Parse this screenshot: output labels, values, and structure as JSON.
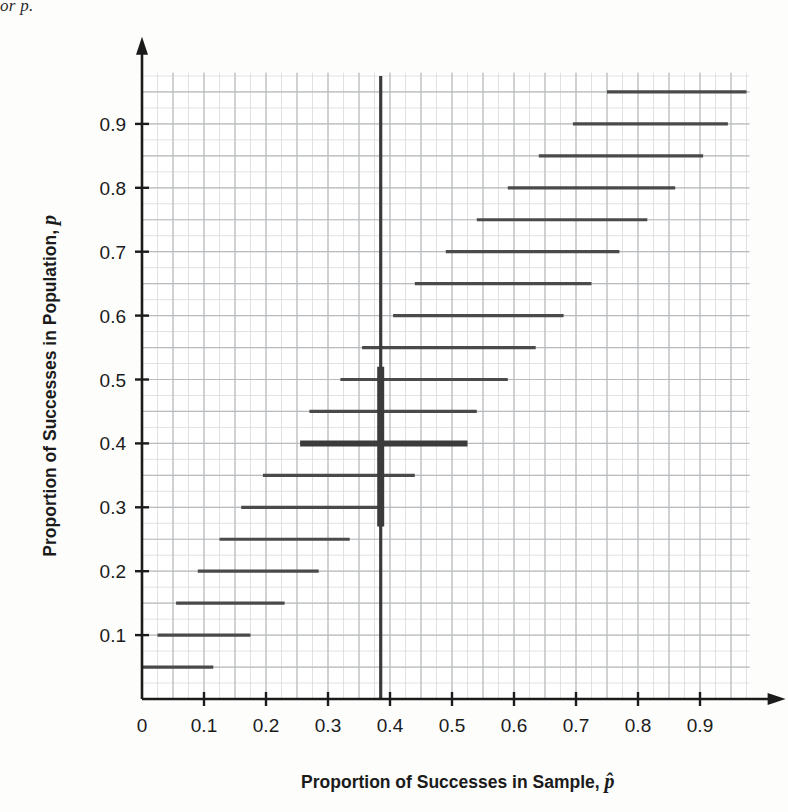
{
  "caption_fragment": "or p.",
  "axes": {
    "x_title_main": "Proportion of Successes in Sample, ",
    "x_title_symbol": "p̂",
    "y_title_main": "Proportion of Successes in Population, ",
    "y_title_symbol": "p",
    "x_ticks": [
      "0",
      "0.1",
      "0.2",
      "0.3",
      "0.4",
      "0.5",
      "0.6",
      "0.7",
      "0.8",
      "0.9"
    ],
    "y_ticks": [
      "0.1",
      "0.2",
      "0.3",
      "0.4",
      "0.5",
      "0.6",
      "0.7",
      "0.8",
      "0.9"
    ]
  },
  "colors": {
    "ink": "#1b1b1b",
    "grid_major": "#b9bcbe",
    "grid_minor": "#d8dadb",
    "segment": "#4a4a4a",
    "highlight": "#3b3b3b",
    "background": "#fdfdfb"
  },
  "chart_data": {
    "type": "line",
    "title": "",
    "xlabel": "Proportion of Successes in Sample, p-hat",
    "ylabel": "Proportion of Successes in Population, p",
    "xlim": [
      0,
      0.98
    ],
    "ylim": [
      0,
      0.98
    ],
    "grid": true,
    "grid_minor_step": 0.025,
    "grid_major_step": 0.05,
    "legend": "none",
    "reference_line": {
      "orientation": "vertical",
      "x": 0.385,
      "y_from": 0.0,
      "y_to": 0.975,
      "emphasis_y_from": 0.27,
      "emphasis_y_to": 0.52
    },
    "highlighted_interval": {
      "p": 0.4,
      "x_low": 0.255,
      "x_high": 0.525
    },
    "intervals": [
      {
        "p": 0.05,
        "x_low": 0.0,
        "x_high": 0.115
      },
      {
        "p": 0.1,
        "x_low": 0.025,
        "x_high": 0.175
      },
      {
        "p": 0.15,
        "x_low": 0.055,
        "x_high": 0.23
      },
      {
        "p": 0.2,
        "x_low": 0.09,
        "x_high": 0.285
      },
      {
        "p": 0.25,
        "x_low": 0.125,
        "x_high": 0.335
      },
      {
        "p": 0.3,
        "x_low": 0.16,
        "x_high": 0.39
      },
      {
        "p": 0.35,
        "x_low": 0.195,
        "x_high": 0.44
      },
      {
        "p": 0.4,
        "x_low": 0.255,
        "x_high": 0.525
      },
      {
        "p": 0.45,
        "x_low": 0.27,
        "x_high": 0.54
      },
      {
        "p": 0.5,
        "x_low": 0.32,
        "x_high": 0.59
      },
      {
        "p": 0.55,
        "x_low": 0.355,
        "x_high": 0.635
      },
      {
        "p": 0.6,
        "x_low": 0.405,
        "x_high": 0.68
      },
      {
        "p": 0.65,
        "x_low": 0.44,
        "x_high": 0.725
      },
      {
        "p": 0.7,
        "x_low": 0.49,
        "x_high": 0.77
      },
      {
        "p": 0.75,
        "x_low": 0.54,
        "x_high": 0.815
      },
      {
        "p": 0.8,
        "x_low": 0.59,
        "x_high": 0.86
      },
      {
        "p": 0.85,
        "x_low": 0.64,
        "x_high": 0.905
      },
      {
        "p": 0.9,
        "x_low": 0.695,
        "x_high": 0.945
      },
      {
        "p": 0.95,
        "x_low": 0.75,
        "x_high": 0.975
      }
    ]
  }
}
